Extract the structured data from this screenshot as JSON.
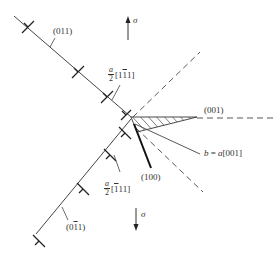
{
  "figure": {
    "type": "crystal dislocation reaction diagram",
    "stress_up": {
      "symbol": "σ",
      "direction": "up"
    },
    "stress_down": {
      "symbol": "σ",
      "direction": "down"
    },
    "labels": {
      "upper_plane": "(011)",
      "lower_plane": {
        "prefix": "(0",
        "bar": "1",
        "suffix": "1)"
      },
      "upper_burgers": {
        "num": "a",
        "den": "2",
        "pre": "[1",
        "bar": "1",
        "post": "1]"
      },
      "lower_burgers": {
        "num": "a",
        "den": "2",
        "pre": "[",
        "bar": "1",
        "post": "11]"
      },
      "crack_plane": "(001)",
      "burgers_b": {
        "b": "b",
        "eq": " = ",
        "a": "a",
        "dir": "[001]"
      },
      "cleavage_plane": "(100)"
    },
    "colors": {
      "line": "#333333",
      "background": "#ffffff"
    }
  }
}
